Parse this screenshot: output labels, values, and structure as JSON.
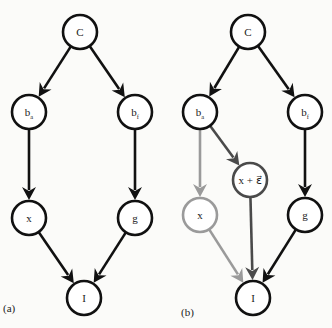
{
  "figure": {
    "panels": [
      {
        "id": "a",
        "label": "(a)",
        "label_pos": [
          3,
          312
        ],
        "nodes": [
          {
            "id": "C",
            "text": "C",
            "sub": "",
            "cx": 80,
            "cy": 32,
            "color": "#111111"
          },
          {
            "id": "ba",
            "text": "b",
            "sub": "a",
            "cx": 29,
            "cy": 112,
            "color": "#111111"
          },
          {
            "id": "bf",
            "text": "b",
            "sub": "f",
            "cx": 135,
            "cy": 112,
            "color": "#111111"
          },
          {
            "id": "x",
            "text": "x",
            "sub": "",
            "cx": 29,
            "cy": 218,
            "color": "#111111"
          },
          {
            "id": "g",
            "text": "g",
            "sub": "",
            "cx": 135,
            "cy": 218,
            "color": "#111111"
          },
          {
            "id": "I",
            "text": "I",
            "sub": "",
            "cx": 84,
            "cy": 298,
            "color": "#111111"
          }
        ],
        "edges": [
          {
            "from": "C",
            "to": "ba",
            "color": "#111111"
          },
          {
            "from": "C",
            "to": "bf",
            "color": "#111111"
          },
          {
            "from": "ba",
            "to": "x",
            "color": "#111111"
          },
          {
            "from": "bf",
            "to": "g",
            "color": "#111111"
          },
          {
            "from": "x",
            "to": "I",
            "color": "#111111"
          },
          {
            "from": "g",
            "to": "I",
            "color": "#111111"
          }
        ]
      },
      {
        "id": "b",
        "label": "(b)",
        "label_pos": [
          181,
          316
        ],
        "nodes": [
          {
            "id": "C",
            "text": "C",
            "sub": "",
            "cx": 248,
            "cy": 32,
            "color": "#111111"
          },
          {
            "id": "ba",
            "text": "b",
            "sub": "a",
            "cx": 200,
            "cy": 112,
            "color": "#111111"
          },
          {
            "id": "bf",
            "text": "b",
            "sub": "f",
            "cx": 305,
            "cy": 112,
            "color": "#111111"
          },
          {
            "id": "x",
            "text": "x",
            "sub": "",
            "cx": 200,
            "cy": 215,
            "color": "#9a9a9a"
          },
          {
            "id": "xe",
            "text": "x + ε⃗",
            "sub": "",
            "cx": 250,
            "cy": 180,
            "color": "#4a4a4a"
          },
          {
            "id": "g",
            "text": "g",
            "sub": "",
            "cx": 305,
            "cy": 215,
            "color": "#111111"
          },
          {
            "id": "I",
            "text": "I",
            "sub": "",
            "cx": 253,
            "cy": 298,
            "color": "#111111"
          }
        ],
        "edges": [
          {
            "from": "C",
            "to": "ba",
            "color": "#111111"
          },
          {
            "from": "C",
            "to": "bf",
            "color": "#111111"
          },
          {
            "from": "ba",
            "to": "x",
            "color": "#9a9a9a"
          },
          {
            "from": "ba",
            "to": "xe",
            "color": "#4a4a4a"
          },
          {
            "from": "bf",
            "to": "g",
            "color": "#111111"
          },
          {
            "from": "x",
            "to": "I",
            "color": "#9a9a9a"
          },
          {
            "from": "xe",
            "to": "I",
            "color": "#4a4a4a"
          },
          {
            "from": "g",
            "to": "I",
            "color": "#111111"
          }
        ]
      }
    ],
    "node_radius": 17,
    "stroke_width": 2.6,
    "colors": {
      "black": "#111111",
      "dark_gray": "#4a4a4a",
      "light_gray": "#9a9a9a",
      "background": "#fbfbf9"
    }
  }
}
